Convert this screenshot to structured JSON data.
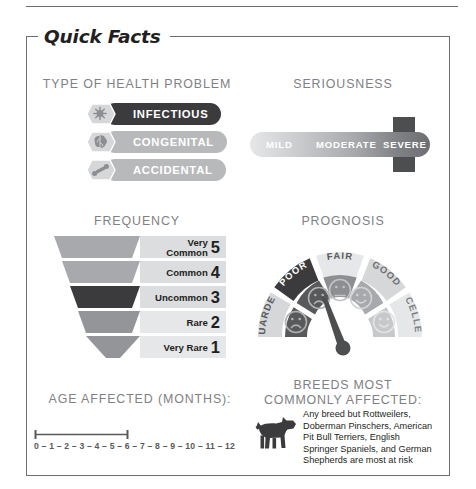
{
  "frame": {
    "title": "Quick Facts"
  },
  "sections": {
    "type_of_health_problem": {
      "heading": "TYPE OF HEALTH PROBLEM",
      "options": [
        {
          "label": "INFECTIOUS",
          "icon": "germ-icon",
          "selected": true
        },
        {
          "label": "CONGENITAL",
          "icon": "brain-icon",
          "selected": false
        },
        {
          "label": "ACCIDENTAL",
          "icon": "bandage-icon",
          "selected": false
        }
      ],
      "selected_value": "INFECTIOUS"
    },
    "seriousness": {
      "heading": "SERIOUSNESS",
      "levels": [
        "MILD",
        "MODERATE",
        "SEVERE"
      ],
      "selected_value": "SEVERE"
    },
    "frequency": {
      "heading": "FREQUENCY",
      "levels": [
        {
          "label": "Very Common",
          "number": "5",
          "selected": false
        },
        {
          "label": "Common",
          "number": "4",
          "selected": false
        },
        {
          "label": "Uncommon",
          "number": "3",
          "selected": true
        },
        {
          "label": "Rare",
          "number": "2",
          "selected": false
        },
        {
          "label": "Very Rare",
          "number": "1",
          "selected": false
        }
      ],
      "selected_value": "Uncommon",
      "selected_number": "3"
    },
    "prognosis": {
      "heading": "PROGNOSIS",
      "segments": [
        {
          "label": "GUARDED",
          "face": "frown",
          "selected": true
        },
        {
          "label": "POOR",
          "face": "frown",
          "selected": true
        },
        {
          "label": "FAIR",
          "face": "neutral",
          "selected": false
        },
        {
          "label": "GOOD",
          "face": "smile",
          "selected": false
        },
        {
          "label": "EXCELLENT",
          "face": "smile",
          "selected": false
        }
      ],
      "selected_value": "POOR"
    },
    "age_affected": {
      "heading": "AGE AFFECTED (MONTHS):",
      "ticks": [
        "0",
        "1",
        "2",
        "3",
        "4",
        "5",
        "6",
        "7",
        "8",
        "9",
        "10",
        "11",
        "12"
      ],
      "range_start": "0",
      "range_end": "6"
    },
    "breeds": {
      "heading_line1": "BREEDS MOST",
      "heading_line2": "COMMONLY AFFECTED:",
      "icon": "dog-icon",
      "body": "Any breed but Rottweilers, Doberman Pinschers, American Pit Bull Terriers, English Springer Spaniels, and German Shepherds are most at risk"
    }
  },
  "colors": {
    "ink": "#231f20",
    "muted": "#808184",
    "selected_dark": "#3b3b3d",
    "unselected_gray": "#b8b9bb",
    "rule": "#6d6e71"
  }
}
